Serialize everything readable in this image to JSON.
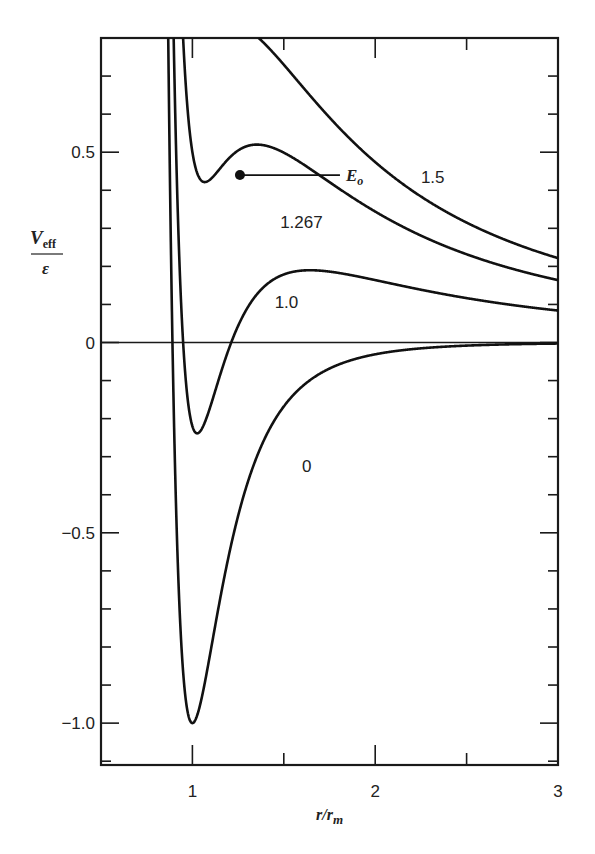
{
  "chart_data": {
    "type": "line",
    "title": "",
    "xlabel": "r/r_m",
    "ylabel": "V_eff / ε",
    "xlim": [
      0.5,
      3.0
    ],
    "ylim": [
      -1.11,
      0.8
    ],
    "grid": false,
    "x_ticks": [
      {
        "value": 1,
        "label": "1"
      },
      {
        "value": 1.5,
        "label": ""
      },
      {
        "value": 2,
        "label": "2"
      },
      {
        "value": 2.5,
        "label": ""
      },
      {
        "value": 3,
        "label": "3"
      }
    ],
    "y_ticks": [
      {
        "value": 0.5,
        "label": "0.5"
      },
      {
        "value": 0,
        "label": "0"
      },
      {
        "value": -0.5,
        "label": "−0.5"
      },
      {
        "value": -1.0,
        "label": "−1.0"
      }
    ],
    "y_minor_step": 0.1,
    "zero_line": true,
    "series": [
      {
        "name": "0",
        "label": "0",
        "centrifugal_coef": 0.0,
        "label_pos": {
          "x": 1.6,
          "y": -0.34
        },
        "points": [
          [
            0.89,
            0.8
          ],
          [
            0.92,
            0.05
          ],
          [
            0.95,
            -0.55
          ],
          [
            1.0,
            -1.0
          ],
          [
            1.05,
            -0.91
          ],
          [
            1.1,
            -0.75
          ],
          [
            1.2,
            -0.52
          ],
          [
            1.3,
            -0.36
          ],
          [
            1.5,
            -0.17
          ],
          [
            1.75,
            -0.07
          ],
          [
            2.0,
            -0.031
          ],
          [
            2.5,
            -0.008
          ],
          [
            3.0,
            -0.003
          ]
        ]
      },
      {
        "name": "1.0",
        "label": "1.0",
        "centrifugal_coef": 0.78,
        "label_pos": {
          "x": 1.45,
          "y": 0.09
        },
        "points": [
          [
            0.91,
            0.8
          ],
          [
            1.0,
            0.0
          ],
          [
            1.1,
            -0.05
          ],
          [
            1.2,
            0.02
          ],
          [
            1.4,
            0.12
          ],
          [
            1.75,
            0.165
          ],
          [
            2.0,
            0.16
          ],
          [
            2.5,
            0.12
          ],
          [
            3.0,
            0.09
          ]
        ]
      },
      {
        "name": "1.267",
        "label": "1.267",
        "centrifugal_coef": 1.5,
        "label_pos": {
          "x": 1.48,
          "y": 0.3
        },
        "points": [
          [
            0.93,
            0.8
          ],
          [
            1.0,
            0.85
          ],
          [
            1.1,
            0.55
          ],
          [
            1.2,
            0.45
          ],
          [
            1.26,
            0.44
          ],
          [
            1.4,
            0.4
          ],
          [
            1.75,
            0.3
          ],
          [
            2.0,
            0.25
          ],
          [
            2.5,
            0.19
          ],
          [
            3.0,
            0.15
          ]
        ]
      },
      {
        "name": "1.5",
        "label": "1.5",
        "centrifugal_coef": 2.02,
        "label_pos": {
          "x": 2.25,
          "y": 0.42
        },
        "points": [
          [
            1.34,
            0.8
          ],
          [
            1.5,
            0.7
          ],
          [
            1.75,
            0.57
          ],
          [
            2.0,
            0.45
          ],
          [
            2.5,
            0.31
          ],
          [
            3.0,
            0.22
          ]
        ]
      }
    ],
    "annotations": [
      {
        "type": "point",
        "x": 1.26,
        "y": 0.44,
        "label": "E_o",
        "label_x": 1.84
      }
    ]
  },
  "labels": {
    "ylabel_main": "V",
    "ylabel_sub": "eff",
    "ylabel_den": "ε",
    "xlabel_main": "r/r",
    "xlabel_sub": "m",
    "e0_main": "E",
    "e0_sub": "o"
  }
}
